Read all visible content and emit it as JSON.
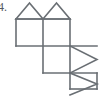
{
  "figure": {
    "item_number": "4.",
    "caption": "",
    "stroke_color": "#6a6f74",
    "fill_color": "#ffffff",
    "background_color": "#ffffff",
    "stroke_width": 1.6,
    "canvas": {
      "width": 106,
      "height": 101
    },
    "shapes": [
      {
        "id": "square-top-left",
        "name": "square",
        "points": "16,19 43,19 43,46 16,46"
      },
      {
        "id": "square-top-right",
        "name": "square",
        "points": "43,19 70,19 70,46 43,46"
      },
      {
        "id": "square-middle",
        "name": "square",
        "points": "43,46 70,46 70,73 43,73"
      },
      {
        "id": "square-middle-right",
        "name": "square",
        "points": "70,46 97,46 97,73 70,73"
      },
      {
        "id": "square-bottom",
        "name": "square",
        "points": "70,73 97,73 97,89 70,89"
      },
      {
        "id": "triangle-top-left",
        "name": "triangle",
        "points": "16,19 29.5,3 43,19"
      },
      {
        "id": "triangle-top-right",
        "name": "triangle",
        "points": "43,19 56.5,3 70,19"
      },
      {
        "id": "triangle-right-upper",
        "name": "triangle",
        "points": "70,46 97,59.5 70,73"
      },
      {
        "id": "triangle-right-lower",
        "name": "triangle",
        "points": "70,73 97,84 70,95"
      }
    ]
  }
}
